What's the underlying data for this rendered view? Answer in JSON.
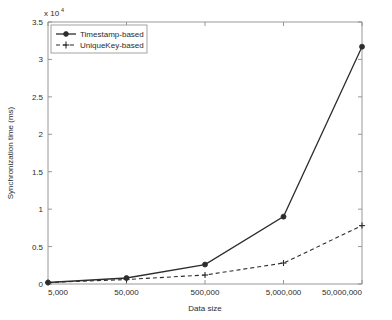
{
  "chart_data": {
    "type": "line",
    "title": "",
    "xlabel": "Data size",
    "ylabel": "Synchronization time (ms)",
    "y_exponent_label": "x 10",
    "y_exponent_value": "4",
    "categories": [
      "5,000",
      "50,000",
      "500,000",
      "5,000,000",
      "50,000,000"
    ],
    "yticks": [
      "0",
      "0.5",
      "1",
      "1.5",
      "2",
      "2.5",
      "3",
      "3.5"
    ],
    "ytick_values": [
      0,
      0.5,
      1,
      1.5,
      2,
      2.5,
      3,
      3.5
    ],
    "ylim": [
      0,
      3.5
    ],
    "y_scale_factor": 10000,
    "grid": false,
    "legend_position": "upper left",
    "series": [
      {
        "name": "Timestamp-based",
        "values": [
          0.02,
          0.08,
          0.26,
          0.9,
          3.17
        ],
        "line_style": "solid",
        "marker": "circle-filled",
        "color": "#2d2d2d"
      },
      {
        "name": "UniqueKey-based",
        "values": [
          0.02,
          0.06,
          0.12,
          0.28,
          0.78
        ],
        "line_style": "dashed",
        "marker": "plus",
        "color": "#2d2d2d"
      }
    ]
  },
  "figure": {
    "background_color": "#ffffff",
    "axis_color": "#8c8c8c",
    "series_color": "#2d2d2d"
  }
}
